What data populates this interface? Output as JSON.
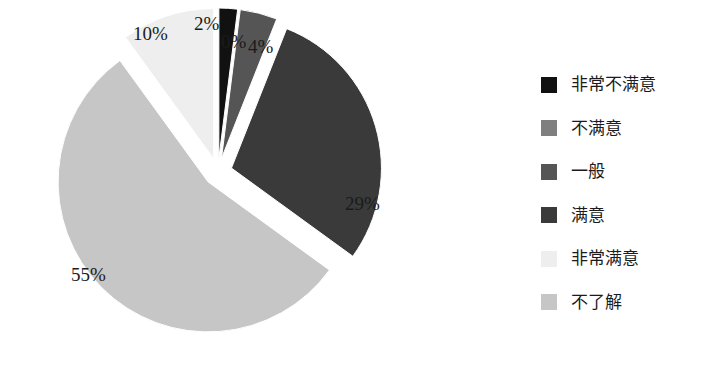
{
  "chart_data": {
    "type": "pie",
    "title": "",
    "subtitle": "",
    "xlabel": "",
    "ylabel": "",
    "exploded": true,
    "grid": false,
    "legend_position": "right",
    "categories": [
      "非常不满意",
      "不满意",
      "一般",
      "满意",
      "非常满意",
      "不了解"
    ],
    "values": [
      2,
      0,
      4,
      29,
      10,
      55
    ],
    "data_labels": [
      "2%",
      "0%",
      "4%",
      "29%",
      "10%",
      "55%"
    ],
    "colors": [
      "#111111",
      "#7f7f7f",
      "#555555",
      "#3a3a3a",
      "#eeeeee",
      "#c6c6c6"
    ],
    "slices": [
      {
        "label": "非常不满意",
        "value": 2,
        "data_label": "2%",
        "color": "#111111"
      },
      {
        "label": "不满意",
        "value": 0,
        "data_label": "0%",
        "color": "#7f7f7f"
      },
      {
        "label": "一般",
        "value": 4,
        "data_label": "4%",
        "color": "#555555"
      },
      {
        "label": "满意",
        "value": 29,
        "data_label": "29%",
        "color": "#3a3a3a"
      },
      {
        "label": "不了解",
        "value": 55,
        "data_label": "55%",
        "color": "#c6c6c6"
      },
      {
        "label": "非常满意",
        "value": 10,
        "data_label": "10%",
        "color": "#eeeeee"
      }
    ]
  },
  "legend": {
    "items": [
      {
        "label": "非常不满意",
        "color": "#111111"
      },
      {
        "label": "不满意",
        "color": "#7f7f7f"
      },
      {
        "label": "一般",
        "color": "#555555"
      },
      {
        "label": "满意",
        "color": "#3a3a3a"
      },
      {
        "label": "非常满意",
        "color": "#eeeeee"
      },
      {
        "label": "不了解",
        "color": "#c6c6c6"
      }
    ]
  },
  "labels": {
    "pct_10": "10%",
    "pct_2": "2%",
    "pct_0": "0%",
    "pct_4": "4%",
    "pct_29": "29%",
    "pct_55": "55%"
  }
}
